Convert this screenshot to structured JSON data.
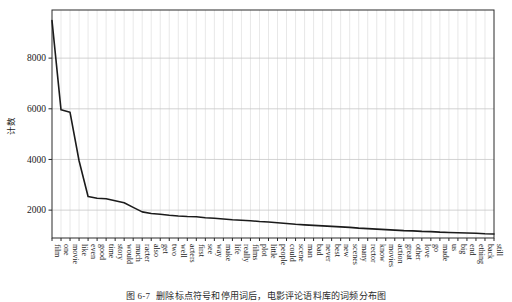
{
  "figure": {
    "caption_number": "图 6-7",
    "caption_text": "删除标点符号和停用词后，电影评论语料库的词频分布图"
  },
  "chart_data": {
    "type": "line",
    "title": "",
    "xlabel": "",
    "ylabel": "计数",
    "ylim": [
      900,
      9900
    ],
    "yticks": [
      2000,
      4000,
      6000,
      8000
    ],
    "ytick_labels": [
      "2000",
      "4000",
      "6000",
      "8000"
    ],
    "grid": true,
    "legend": "none",
    "line_color": "#1b1b1b",
    "grid_color": "#c8c8c8",
    "categories": [
      "film",
      "one",
      "movie",
      "like",
      "even",
      "good",
      "time",
      "story",
      "would",
      "much",
      "racter",
      "also",
      "get",
      "two",
      "well",
      "acters",
      "first",
      "see",
      "way",
      "make",
      "life",
      "really",
      "films",
      "plot",
      "little",
      "people",
      "could",
      "scene",
      "man",
      "bad",
      "never",
      "best",
      "new",
      "scenes",
      "many",
      "rector",
      "know",
      "movies",
      "action",
      "great",
      "other",
      "love",
      "go",
      "made",
      "us",
      "big",
      "end",
      "ething",
      "back",
      "still"
    ],
    "values": [
      9480,
      5960,
      5860,
      3950,
      2540,
      2470,
      2450,
      2370,
      2290,
      2110,
      1930,
      1870,
      1840,
      1800,
      1770,
      1750,
      1740,
      1700,
      1680,
      1650,
      1620,
      1600,
      1580,
      1550,
      1530,
      1500,
      1470,
      1440,
      1420,
      1400,
      1380,
      1360,
      1340,
      1320,
      1290,
      1270,
      1250,
      1230,
      1210,
      1190,
      1180,
      1160,
      1150,
      1130,
      1120,
      1110,
      1100,
      1090,
      1070,
      1060
    ]
  }
}
